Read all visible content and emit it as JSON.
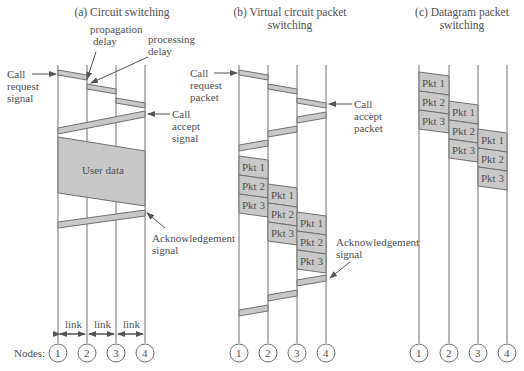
{
  "panels": [
    {
      "title_line1": "(a)  Circuit switching",
      "title_line2": "",
      "labels": {
        "propagation_delay": [
          "propagation",
          "delay"
        ],
        "processing_delay": [
          "processing",
          "delay"
        ],
        "call_request": [
          "Call",
          "request",
          "signal"
        ],
        "call_accept": [
          "Call",
          "accept",
          "signal"
        ],
        "user_data": "User data",
        "acknowledgement": [
          "Acknowledgement",
          "signal"
        ],
        "link": "link"
      }
    },
    {
      "title_line1": "(b) Virtual circuit packet",
      "title_line2": "switching",
      "labels": {
        "call_request": [
          "Call",
          "request",
          "packet"
        ],
        "call_accept": [
          "Call",
          "accept",
          "packet"
        ],
        "acknowledgement": [
          "Acknowledgement",
          "signal"
        ]
      },
      "packets": [
        "Pkt 1",
        "Pkt 2",
        "Pkt 3"
      ]
    },
    {
      "title_line1": "(c) Datagram packet",
      "title_line2": "switching",
      "packets": [
        "Pkt 1",
        "Pkt 2",
        "Pkt 3"
      ]
    }
  ],
  "nodes_label": "Nodes:",
  "node_numbers": [
    "1",
    "2",
    "3",
    "4"
  ],
  "colors": {
    "band_fill": "#c8c8c8",
    "line": "#6a6a6a",
    "text": "#505050"
  }
}
